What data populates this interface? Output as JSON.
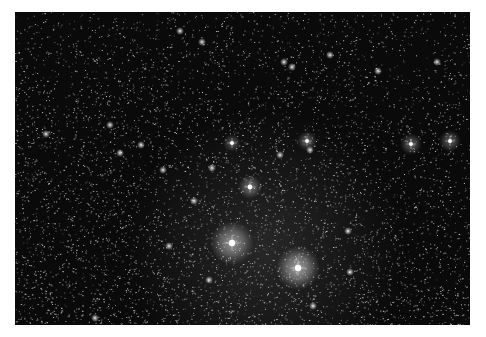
{
  "image": {
    "subject": "star-field",
    "background_color": "#ffffff",
    "sky_color": "#0a0a0a",
    "frame": {
      "x": 15,
      "y": 12,
      "width": 455,
      "height": 313
    }
  },
  "bright_stars": [
    {
      "x": 232,
      "y": 243,
      "glow": 22,
      "core": 3.2,
      "halo_alpha": 0.55
    },
    {
      "x": 298,
      "y": 268,
      "glow": 22,
      "core": 3.2,
      "halo_alpha": 0.6
    },
    {
      "x": 250,
      "y": 187,
      "glow": 12,
      "core": 2.4,
      "halo_alpha": 0.4
    },
    {
      "x": 232,
      "y": 143,
      "glow": 9,
      "core": 2.0,
      "halo_alpha": 0.3
    },
    {
      "x": 307,
      "y": 141,
      "glow": 10,
      "core": 2.0,
      "halo_alpha": 0.35
    },
    {
      "x": 411,
      "y": 144,
      "glow": 11,
      "core": 2.0,
      "halo_alpha": 0.35
    },
    {
      "x": 450,
      "y": 141,
      "glow": 11,
      "core": 2.0,
      "halo_alpha": 0.35
    }
  ],
  "medium_stars": [
    {
      "x": 46,
      "y": 134
    },
    {
      "x": 141,
      "y": 145
    },
    {
      "x": 180,
      "y": 31
    },
    {
      "x": 284,
      "y": 62
    },
    {
      "x": 292,
      "y": 67
    },
    {
      "x": 378,
      "y": 71
    },
    {
      "x": 437,
      "y": 62
    },
    {
      "x": 110,
      "y": 125
    },
    {
      "x": 120,
      "y": 153
    },
    {
      "x": 348,
      "y": 231
    },
    {
      "x": 313,
      "y": 306
    },
    {
      "x": 169,
      "y": 246
    },
    {
      "x": 194,
      "y": 201
    },
    {
      "x": 212,
      "y": 168
    },
    {
      "x": 202,
      "y": 42
    },
    {
      "x": 163,
      "y": 170
    },
    {
      "x": 310,
      "y": 150
    },
    {
      "x": 280,
      "y": 155
    },
    {
      "x": 330,
      "y": 55
    },
    {
      "x": 95,
      "y": 318
    },
    {
      "x": 350,
      "y": 272
    },
    {
      "x": 209,
      "y": 280
    }
  ],
  "noise": {
    "faint_star_count": 9000,
    "seed": 42,
    "nebula_glow_center": {
      "x": 265,
      "y": 250,
      "radius": 140,
      "alpha": 0.12
    }
  }
}
